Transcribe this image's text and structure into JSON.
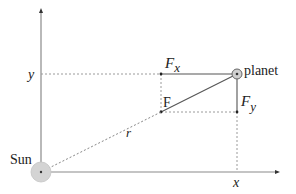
{
  "diagram": {
    "labels": {
      "y_axis": "y",
      "x_axis": "x",
      "sun": "Sun",
      "planet": "planet",
      "force": "F",
      "fx_main": "F",
      "fx_sub": "x",
      "fy_main": "F",
      "fy_sub": "y",
      "radius": "r"
    },
    "colors": {
      "axis": "#8a8a8a",
      "line": "#555555",
      "dotted": "#9a9a9a",
      "sun_fill": "#d4d4d4",
      "planet_fill": "#cfcfcf"
    }
  }
}
